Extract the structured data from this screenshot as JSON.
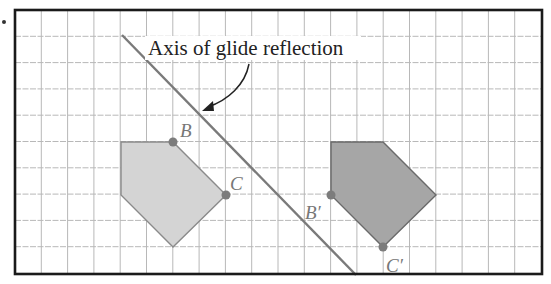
{
  "figure": {
    "title_label": "Axis of glide reflection",
    "bullet": "•",
    "grid": {
      "left": 15,
      "top": 10,
      "right": 542,
      "bottom": 274,
      "spacing": 26.3,
      "line_color": "#b8b8b8",
      "border_color": "#1a1a1a"
    },
    "axis_line": {
      "x1": 122,
      "y1": 35,
      "x2": 356,
      "y2": 275,
      "color": "#7a7a7a"
    },
    "preimage": {
      "fill": "#d4d4d4",
      "stroke": "#8a8a8a",
      "points": "121,142 173,142 226,195 173,247 121,195",
      "labels": {
        "B": "B",
        "C": "C"
      }
    },
    "image": {
      "fill": "#a6a6a6",
      "stroke": "#6a6a6a",
      "points": "331,142 383,142 436,195 383,247 331,195",
      "labels": {
        "B_prime": "B′",
        "C_prime": "C′"
      }
    },
    "point_color": "#7c7c7c",
    "text_color": "#222222"
  }
}
